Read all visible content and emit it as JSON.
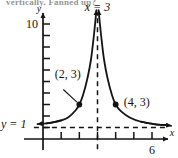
{
  "figure": {
    "cut_header_text": "vertically. Fanned up?",
    "background": "#ffffff",
    "ink_color": "#141414"
  },
  "chart_data": {
    "type": "line",
    "title": "",
    "subtitle": "",
    "xlabel": "x",
    "ylabel": "y",
    "xlim": [
      -0.6,
      7.2
    ],
    "ylim": [
      -1.2,
      11.5
    ],
    "grid": false,
    "legend": null,
    "function_description": "Rational function with vertical asymptote x = 3 and horizontal asymptote y = 1",
    "asymptotes": [
      {
        "name": "vertical-asymptote",
        "label": "x = 3",
        "kind": "vertical",
        "value": 3,
        "style": "dashed"
      },
      {
        "name": "horizontal-asymptote",
        "label": "y = 1",
        "kind": "horizontal",
        "value": 1,
        "style": "dashed"
      }
    ],
    "branches": [
      {
        "name": "left-branch",
        "approaches": "up along x=3 from the left, right along y=1 going left",
        "x": [
          0.2,
          0.6,
          1.0,
          1.4,
          1.8,
          2.0,
          2.2,
          2.45,
          2.65,
          2.8,
          2.88,
          2.94
        ],
        "y": [
          1.36,
          1.46,
          1.62,
          1.9,
          2.5,
          3.0,
          3.8,
          5.3,
          7.0,
          9.0,
          10.2,
          11.2
        ]
      },
      {
        "name": "right-branch",
        "approaches": "up along x=3 from the right, right along y=1 going right",
        "x": [
          3.06,
          3.12,
          3.2,
          3.35,
          3.55,
          3.8,
          4.0,
          4.3,
          4.8,
          5.4,
          6.1,
          6.8
        ],
        "y": [
          11.2,
          10.2,
          9.0,
          7.0,
          5.3,
          3.8,
          3.0,
          2.4,
          1.85,
          1.5,
          1.3,
          1.2
        ]
      }
    ],
    "points": [
      {
        "name": "point-2-3",
        "label": "(2, 3)",
        "x": 2,
        "y": 3,
        "label_dx": -1.35,
        "label_dy": 2.3
      },
      {
        "name": "point-4-3",
        "label": "(4, 3)",
        "x": 4,
        "y": 3,
        "label_dx": 0.45,
        "label_dy": -0.15
      }
    ],
    "y_axis": {
      "label": "y",
      "tick_values": [
        1,
        2,
        3,
        4,
        5,
        6,
        7,
        8,
        9,
        10
      ],
      "labeled_ticks": [
        {
          "value": 10,
          "text": "10"
        }
      ],
      "arrow": true
    },
    "x_axis": {
      "label": "x",
      "tick_values": [
        1,
        2,
        3,
        4,
        5,
        6
      ],
      "labeled_ticks": [
        {
          "value": 6,
          "text": "6"
        }
      ],
      "arrow": true
    },
    "annotations": [
      {
        "name": "vertical-asymptote-label",
        "text": "x = 3",
        "x": 3,
        "y": 11.3
      },
      {
        "name": "horizontal-asymptote-label",
        "text": "y = 1",
        "x": -0.55,
        "y": 1.45
      }
    ]
  }
}
